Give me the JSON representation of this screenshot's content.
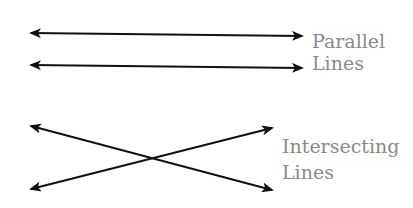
{
  "diagram": {
    "parallel": {
      "label_line1": "Parallel",
      "label_line2": "Lines"
    },
    "intersecting": {
      "label_line1": "Intersecting",
      "label_line2": "Lines"
    },
    "colors": {
      "line": "#111111",
      "label": "#8a8a8a",
      "background": "#ffffff"
    }
  }
}
